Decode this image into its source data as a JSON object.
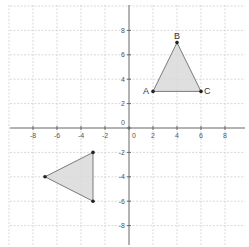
{
  "chart_data": {
    "type": "scatter",
    "title": "",
    "xlabel": "",
    "ylabel": "",
    "xlim": [
      -10,
      10
    ],
    "ylim": [
      -10,
      10
    ],
    "grid": true,
    "grid_step": 2,
    "x_ticks": [
      -8,
      -6,
      -4,
      -2,
      0,
      2,
      4,
      6,
      8
    ],
    "y_ticks": [
      8,
      6,
      4,
      2,
      0,
      -2,
      -4,
      -6,
      -8
    ],
    "x_tick_labels": [
      "-8",
      "-6",
      "-4",
      "-2",
      "0",
      "2",
      "4",
      "6",
      "8"
    ],
    "y_tick_labels": [
      "8",
      "6",
      "4",
      "2",
      "0",
      "-2",
      "-4",
      "-6",
      "-8"
    ],
    "shapes": [
      {
        "name": "triangle-abc",
        "type": "polygon",
        "vertices": [
          {
            "label": "A",
            "x": 2,
            "y": 3
          },
          {
            "label": "B",
            "x": 4,
            "y": 7
          },
          {
            "label": "C",
            "x": 6,
            "y": 3
          }
        ]
      },
      {
        "name": "triangle-image",
        "type": "polygon",
        "vertices": [
          {
            "label": "",
            "x": -3,
            "y": -2
          },
          {
            "label": "",
            "x": -7,
            "y": -4
          },
          {
            "label": "",
            "x": -3,
            "y": -6
          }
        ]
      }
    ],
    "fill_color": "#d9d9d9",
    "edge_color": "#7a7a7a",
    "point_color": "#222222"
  }
}
